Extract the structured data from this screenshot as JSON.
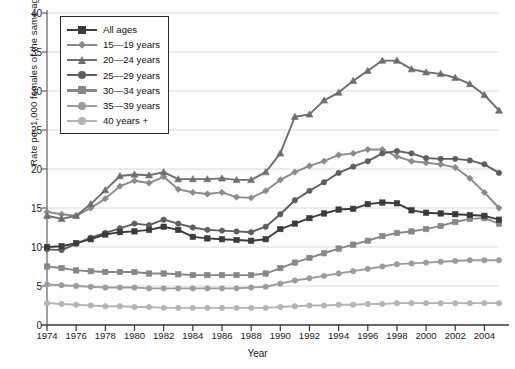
{
  "chart_data": {
    "type": "line",
    "title": "",
    "xlabel": "Year",
    "ylabel": "Rate per 1,000 females of the same age group",
    "xlim": [
      1974,
      2005
    ],
    "ylim": [
      0,
      40
    ],
    "ytick_step": 5,
    "xtick_step": 2,
    "grid": "horizontal",
    "legend_position": "top-left",
    "x": [
      1974,
      1975,
      1976,
      1977,
      1978,
      1979,
      1980,
      1981,
      1982,
      1983,
      1984,
      1985,
      1986,
      1987,
      1988,
      1989,
      1990,
      1991,
      1992,
      1993,
      1994,
      1995,
      1996,
      1997,
      1998,
      1999,
      2000,
      2001,
      2002,
      2003,
      2004,
      2005
    ],
    "ytick_labels": [
      "0",
      "5",
      "10",
      "15",
      "20",
      "25",
      "30",
      "35",
      "40"
    ],
    "xtick_labels": [
      "1974",
      "1976",
      "1978",
      "1980",
      "1982",
      "1984",
      "1986",
      "1988",
      "1990",
      "1992",
      "1994",
      "1996",
      "1998",
      "2000",
      "2002",
      "2004"
    ],
    "series": [
      {
        "name": "All ages",
        "marker": "square",
        "color": "#3b3b3b",
        "values": [
          10.0,
          10.1,
          10.5,
          11.0,
          11.6,
          11.9,
          12.0,
          12.2,
          12.6,
          12.2,
          11.3,
          11.1,
          11.0,
          10.9,
          10.8,
          11.0,
          12.3,
          13.0,
          13.7,
          14.3,
          14.8,
          14.9,
          15.5,
          15.7,
          15.6,
          14.7,
          14.4,
          14.3,
          14.2,
          14.1,
          14.0,
          13.5
        ]
      },
      {
        "name": "15—19 years",
        "marker": "diamond",
        "color": "#8a8a8a",
        "values": [
          14.5,
          14.2,
          14.0,
          15.0,
          16.2,
          17.8,
          18.5,
          18.2,
          19.0,
          17.4,
          17.0,
          16.8,
          17.0,
          16.4,
          16.3,
          17.2,
          18.6,
          19.6,
          20.4,
          21.0,
          21.8,
          22.0,
          22.5,
          22.5,
          21.6,
          21.0,
          20.8,
          20.6,
          20.2,
          18.8,
          17.0,
          15.0
        ]
      },
      {
        "name": "20—24 years",
        "marker": "triangle",
        "color": "#6e6e6e",
        "values": [
          14.0,
          13.6,
          14.0,
          15.5,
          17.3,
          19.1,
          19.3,
          19.2,
          19.6,
          18.7,
          18.7,
          18.7,
          18.8,
          18.6,
          18.6,
          19.6,
          22.0,
          26.7,
          27.0,
          28.8,
          29.8,
          31.3,
          32.6,
          33.9,
          33.9,
          32.8,
          32.4,
          32.2,
          31.7,
          30.9,
          29.5,
          27.5
        ]
      },
      {
        "name": "25—29 years",
        "marker": "circle",
        "color": "#5e5e5e",
        "values": [
          9.7,
          9.6,
          10.4,
          11.2,
          11.8,
          12.4,
          13.0,
          12.8,
          13.5,
          13.0,
          12.5,
          12.2,
          12.1,
          12.0,
          11.9,
          12.6,
          14.2,
          16.0,
          17.2,
          18.3,
          19.5,
          20.3,
          21.0,
          22.0,
          22.3,
          22.0,
          21.4,
          21.3,
          21.3,
          21.1,
          20.6,
          19.5
        ]
      },
      {
        "name": "30—34 years",
        "marker": "square",
        "color": "#878787",
        "values": [
          7.5,
          7.3,
          7.0,
          6.9,
          6.8,
          6.8,
          6.8,
          6.6,
          6.6,
          6.5,
          6.4,
          6.4,
          6.4,
          6.4,
          6.4,
          6.6,
          7.3,
          8.0,
          8.6,
          9.2,
          9.8,
          10.3,
          10.8,
          11.4,
          11.8,
          12.0,
          12.3,
          12.7,
          13.2,
          13.6,
          13.7,
          13.0
        ]
      },
      {
        "name": "35—39 years",
        "marker": "circle",
        "color": "#9c9c9c",
        "values": [
          5.2,
          5.1,
          5.0,
          4.9,
          4.8,
          4.8,
          4.8,
          4.7,
          4.7,
          4.7,
          4.7,
          4.7,
          4.7,
          4.7,
          4.8,
          4.9,
          5.3,
          5.7,
          6.0,
          6.3,
          6.6,
          6.9,
          7.2,
          7.5,
          7.8,
          7.9,
          8.0,
          8.1,
          8.2,
          8.3,
          8.3,
          8.3
        ]
      },
      {
        "name": "40 years +",
        "marker": "circle",
        "color": "#b4b4b4",
        "values": [
          2.8,
          2.7,
          2.6,
          2.5,
          2.4,
          2.4,
          2.3,
          2.3,
          2.2,
          2.2,
          2.2,
          2.2,
          2.2,
          2.2,
          2.2,
          2.2,
          2.3,
          2.4,
          2.5,
          2.5,
          2.6,
          2.6,
          2.7,
          2.7,
          2.8,
          2.8,
          2.8,
          2.8,
          2.8,
          2.8,
          2.8,
          2.8
        ]
      }
    ]
  }
}
